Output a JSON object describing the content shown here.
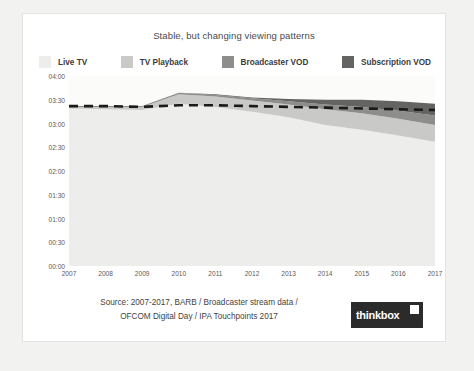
{
  "chart_title": "Stable, but changing viewing patterns",
  "source": {
    "line1": "Source: 2007-2017, BARB / Broadcaster stream data /",
    "line2": "OFCOM Digital Day / IPA Touchpoints 2017"
  },
  "logo": {
    "text": "thinkbox"
  },
  "colors": {
    "live_tv": "#ededeb",
    "tv_playback": "#c9c9c7",
    "broadcaster_vod": "#8d8d8b",
    "subscription_vod": "#646462",
    "total_line": "#1a1a1a",
    "plot_bg": "#fbfbfa"
  },
  "chart_data": {
    "type": "area",
    "title": "Stable, but changing viewing patterns",
    "xlabel": "",
    "ylabel": "",
    "grid": false,
    "legend_position": "top",
    "stacked": true,
    "categories": [
      "2007",
      "2008",
      "2009",
      "2010",
      "2011",
      "2012",
      "2013",
      "2014",
      "2015",
      "2016",
      "2017"
    ],
    "ytick_labels": [
      "04:00",
      "03:30",
      "03:00",
      "02:30",
      "02:00",
      "01:30",
      "01:00",
      "00:30",
      "00:00"
    ],
    "ytick_minutes": [
      240,
      210,
      180,
      150,
      120,
      90,
      60,
      30,
      0
    ],
    "ylim_minutes": [
      0,
      240
    ],
    "series": [
      {
        "name": "Live TV",
        "values": [
          199,
          198,
          197,
          205,
          201,
          195,
          188,
          178,
          172,
          165,
          157
        ]
      },
      {
        "name": "TV Playback",
        "values": [
          2,
          3,
          4,
          12,
          13,
          14,
          16,
          20,
          21,
          21,
          21
        ]
      },
      {
        "name": "Broadcaster VOD",
        "values": [
          1,
          1,
          1,
          2,
          2,
          3,
          4,
          6,
          8,
          10,
          12
        ]
      },
      {
        "name": "Subscription VOD",
        "values": [
          0,
          0,
          0,
          0,
          1,
          1,
          3,
          6,
          9,
          12,
          15
        ]
      }
    ],
    "overlay_line": {
      "name": "Total viewing",
      "style": "dashed",
      "values": [
        202,
        202,
        201,
        203,
        203,
        202,
        201,
        200,
        199,
        198,
        197
      ]
    }
  },
  "legend": {
    "items": [
      {
        "label": "Live TV",
        "color": "#ededeb"
      },
      {
        "label": "TV Playback",
        "color": "#c9c9c7"
      },
      {
        "label": "Broadcaster VOD",
        "color": "#8d8d8b"
      },
      {
        "label": "Subscription VOD",
        "color": "#646462"
      }
    ]
  }
}
